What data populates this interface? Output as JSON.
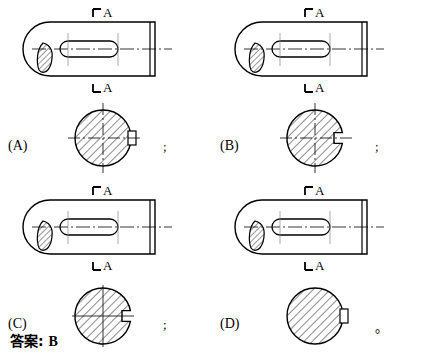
{
  "page": {
    "question_type": "engineering-drawing-multiple-choice",
    "answer_prefix": "答案:",
    "answer_value": "B",
    "separator_semicolon": ";",
    "separator_period": "。"
  },
  "options": [
    {
      "id": "A",
      "label": "(A)",
      "separator": ";",
      "front_view": {
        "section_label_top": "A",
        "section_label_bottom": "A",
        "description": "shaft front view with rounded left end, broken-out hatched section at left, keyway slot outline in middle, chamfered right end, dash-dot centerline"
      },
      "section_view": {
        "title": "A-A",
        "keyway_style": "keyway-outside-rectangle",
        "hatch_direction": "up-right",
        "has_centerlines": true,
        "centerline_style": "dash-dot",
        "description": "full circle fully hatched with small rectangle drawn outside at right edge, keyway not cut into circle"
      }
    },
    {
      "id": "B",
      "label": "(B)",
      "separator": ";",
      "front_view": {
        "section_label_top": "A",
        "section_label_bottom": "A",
        "description": "shaft front view with rounded left end, broken-out hatched section at left, keyway slot outline in middle, chamfered right end, dash-dot centerline"
      },
      "section_view": {
        "title": "A-A",
        "keyway_style": "keyway-notch-cut-in",
        "hatch_direction": "up-right",
        "has_centerlines": true,
        "centerline_style": "dash-dot",
        "description": "circle with rectangular keyway notch cut into right edge, hatching stops at keyway, correct representation"
      }
    },
    {
      "id": "C",
      "label": "(C)",
      "separator": ";",
      "front_view": {
        "section_label_top": "A",
        "section_label_bottom": "A",
        "description": "shaft front view with rounded left end, broken-out hatched section at left, keyway slot outline in middle, chamfered right end, dash-dot centerline"
      },
      "section_view": {
        "title": "A-A",
        "keyway_style": "keyway-notch-cut-in",
        "hatch_direction": "up-right",
        "has_centerlines": true,
        "centerline_style": "continuous-thin",
        "description": "circle with keyway notch cut in but centerlines drawn as continuous thin lines instead of dash-dot"
      }
    },
    {
      "id": "D",
      "label": "(D)",
      "separator": "。",
      "front_view": {
        "section_label_top": "A",
        "section_label_bottom": "A",
        "description": "shaft front view with rounded left end, broken-out hatched section at left, keyway slot outline in middle, chamfered right end, dash-dot centerline"
      },
      "section_view": {
        "title": "A-A",
        "keyway_style": "keyway-outside-rectangle",
        "hatch_direction": "up-right",
        "has_centerlines": false,
        "centerline_style": "none",
        "description": "full circle hatched with small rectangle outside at right edge, no centerlines shown"
      }
    }
  ],
  "colors": {
    "line": "#000000",
    "background": "#ffffff",
    "hatch": "#000000"
  }
}
